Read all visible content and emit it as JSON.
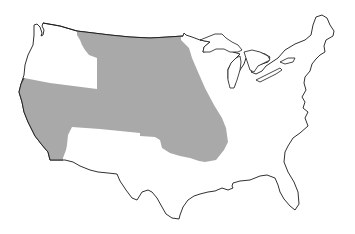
{
  "map": {
    "subject": "Contiguous United States",
    "highlighted_region_label": "Shaded region",
    "colors": {
      "background": "#ffffff",
      "land": "#ffffff",
      "highlight": "#a9a9a9",
      "outline": "#1a1a1a"
    }
  }
}
